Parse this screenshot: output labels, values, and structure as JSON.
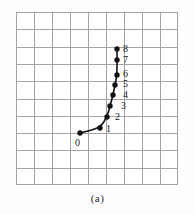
{
  "figure": {
    "caption": "(a)",
    "background_color": "#fdfdfd"
  },
  "chart_data": {
    "type": "line",
    "title": "",
    "subtitle": "",
    "xlabel": "",
    "ylabel": "",
    "caption": "(a)",
    "grid": true,
    "grid_color": "#a0a0a0",
    "grid_columns": 9,
    "grid_rows": 10,
    "axis_tick_labels_x": [],
    "axis_tick_labels_y": [],
    "legend": [],
    "legend_position": "none",
    "series_color": "#111111",
    "marker": "filled-circle",
    "marker_labels": [
      "0",
      "1",
      "2",
      "3",
      "4",
      "5",
      "6",
      "7",
      "8"
    ],
    "x": [
      0.0,
      1.11,
      1.5,
      1.67,
      1.83,
      1.94,
      2.06,
      2.28,
      2.28
    ],
    "y": [
      3.0,
      3.28,
      3.89,
      4.5,
      5.11,
      5.72,
      6.33,
      7.22,
      7.83
    ],
    "points_px": [
      {
        "label": "0",
        "cx": 64,
        "cy": 121
      },
      {
        "label": "1",
        "cx": 84,
        "cy": 116
      },
      {
        "label": "2",
        "cx": 91,
        "cy": 105
      },
      {
        "label": "3",
        "cx": 94,
        "cy": 94
      },
      {
        "label": "4",
        "cx": 97,
        "cy": 83
      },
      {
        "label": "5",
        "cx": 99,
        "cy": 73
      },
      {
        "label": "6",
        "cx": 101,
        "cy": 63
      },
      {
        "label": "7",
        "cx": 101,
        "cy": 48
      },
      {
        "label": "8",
        "cx": 101,
        "cy": 37
      }
    ],
    "labels_px": [
      {
        "text": "0",
        "x": 59,
        "y": 126
      },
      {
        "text": "1",
        "x": 90,
        "y": 112
      },
      {
        "text": "2",
        "x": 99,
        "y": 100
      },
      {
        "text": "3",
        "x": 105,
        "y": 89
      },
      {
        "text": "4",
        "x": 107,
        "y": 78
      },
      {
        "text": "5",
        "x": 107,
        "y": 67
      },
      {
        "text": "6",
        "x": 107,
        "y": 57
      },
      {
        "text": "7",
        "x": 107,
        "y": 43
      },
      {
        "text": "8",
        "x": 107,
        "y": 32
      }
    ]
  }
}
